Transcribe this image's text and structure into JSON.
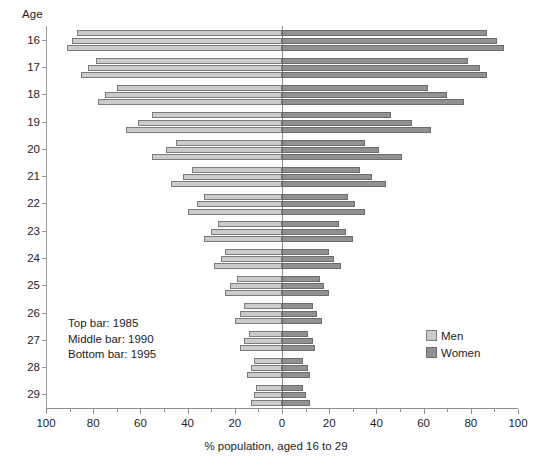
{
  "chart_data": {
    "type": "bar",
    "subtype": "population-pyramid",
    "title": "",
    "xlabel": "% population, aged 16 to 29",
    "ylabel": "Age",
    "categories": [
      16,
      17,
      18,
      19,
      20,
      21,
      22,
      23,
      24,
      25,
      26,
      27,
      28,
      29
    ],
    "xlim": [
      -100,
      100
    ],
    "xticks": [
      100,
      80,
      60,
      40,
      20,
      0,
      20,
      40,
      60,
      80,
      100
    ],
    "xtick_labels": [
      "100",
      "80",
      "60",
      "40",
      "20",
      "0",
      "20",
      "40",
      "60",
      "80",
      "100"
    ],
    "grid": false,
    "legend_position": "center-right",
    "series": [
      {
        "name": "Men",
        "side": "left",
        "color": "#cbcbcb",
        "years": [
          1985,
          1990,
          1995
        ],
        "values": [
          [
            87,
            89,
            91
          ],
          [
            79,
            82,
            85
          ],
          [
            70,
            75,
            78
          ],
          [
            55,
            61,
            66
          ],
          [
            45,
            49,
            55
          ],
          [
            38,
            42,
            47
          ],
          [
            33,
            36,
            40
          ],
          [
            27,
            30,
            33
          ],
          [
            24,
            26,
            29
          ],
          [
            19,
            22,
            24
          ],
          [
            16,
            18,
            20
          ],
          [
            14,
            16,
            18
          ],
          [
            12,
            13,
            15
          ],
          [
            11,
            12,
            13
          ]
        ]
      },
      {
        "name": "Women",
        "side": "right",
        "color": "#919191",
        "years": [
          1985,
          1990,
          1995
        ],
        "values": [
          [
            87,
            91,
            94
          ],
          [
            79,
            84,
            87
          ],
          [
            62,
            70,
            77
          ],
          [
            46,
            55,
            63
          ],
          [
            35,
            41,
            51
          ],
          [
            33,
            38,
            44
          ],
          [
            28,
            31,
            35
          ],
          [
            24,
            27,
            30
          ],
          [
            20,
            22,
            25
          ],
          [
            16,
            18,
            20
          ],
          [
            13,
            15,
            17
          ],
          [
            11,
            13,
            14
          ],
          [
            9,
            11,
            12
          ],
          [
            9,
            10,
            12
          ]
        ]
      }
    ],
    "annotations": [
      "Top bar: 1985",
      "Middle bar: 1990",
      "Bottom bar: 1995"
    ]
  },
  "axis": {
    "y_title": "Age",
    "x_title": "% population, aged 16 to 29"
  },
  "legend": {
    "items": [
      {
        "label": "Men",
        "color": "#cbcbcb"
      },
      {
        "label": "Women",
        "color": "#919191"
      }
    ]
  },
  "notes": {
    "line1": "Top bar: 1985",
    "line2": "Middle bar: 1990",
    "line3": "Bottom bar: 1995"
  }
}
